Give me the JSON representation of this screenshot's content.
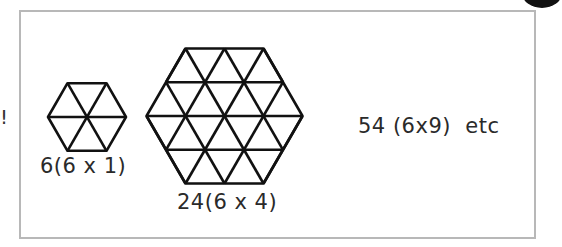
{
  "side_mark": "!",
  "figures": [
    {
      "id": "hex-size-1",
      "label": "6(6 x 1)",
      "triangles": 6,
      "side_subdivisions": 1
    },
    {
      "id": "hex-size-2",
      "label": "24(6 x 4)",
      "triangles": 24,
      "side_subdivisions": 2
    }
  ],
  "next_term": "54 (6x9)  etc",
  "colors": {
    "frame": "#b8b8b8",
    "lines": "#111111",
    "text": "#2a2a2a"
  }
}
